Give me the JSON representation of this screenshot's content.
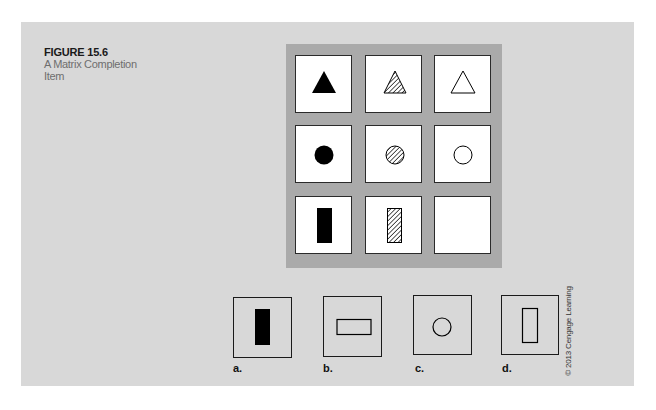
{
  "figure": {
    "number": "FIGURE 15.6",
    "title": "A Matrix Completion Item"
  },
  "matrix": {
    "rows": [
      [
        {
          "shape": "triangle",
          "fill": "solid"
        },
        {
          "shape": "triangle",
          "fill": "hatched"
        },
        {
          "shape": "triangle",
          "fill": "outline"
        }
      ],
      [
        {
          "shape": "circle",
          "fill": "solid"
        },
        {
          "shape": "circle",
          "fill": "hatched"
        },
        {
          "shape": "circle",
          "fill": "outline"
        }
      ],
      [
        {
          "shape": "rectangle-vertical",
          "fill": "solid"
        },
        {
          "shape": "rectangle-vertical",
          "fill": "hatched"
        },
        {
          "shape": "empty",
          "fill": "none"
        }
      ]
    ]
  },
  "options": [
    {
      "label": "a.",
      "shape": "rectangle-vertical",
      "fill": "solid"
    },
    {
      "label": "b.",
      "shape": "rectangle-horizontal",
      "fill": "outline"
    },
    {
      "label": "c.",
      "shape": "circle",
      "fill": "outline"
    },
    {
      "label": "d.",
      "shape": "rectangle-vertical",
      "fill": "outline"
    }
  ],
  "copyright": "© 2013 Cengage Learning",
  "colors": {
    "panel": "#d8d8d8",
    "matrix_frame": "#aaaaaa",
    "ink": "#000000"
  }
}
